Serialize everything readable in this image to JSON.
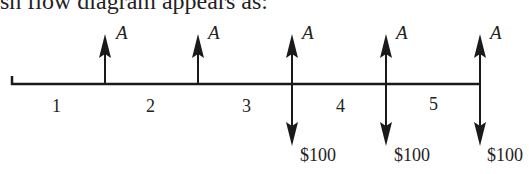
{
  "header": {
    "text": "sh flow diagram appears as:"
  },
  "diagram": {
    "type": "cash-flow-diagram",
    "periods": [
      "1",
      "2",
      "3",
      "4",
      "5"
    ],
    "receipts": [
      {
        "label": "A",
        "at_end_of_period": 1
      },
      {
        "label": "A",
        "at_end_of_period": 2
      },
      {
        "label": "A",
        "at_end_of_period": 3
      },
      {
        "label": "A",
        "at_end_of_period": 4
      },
      {
        "label": "A",
        "at_end_of_period": 5
      }
    ],
    "disbursements": [
      {
        "label": "$100",
        "at_end_of_period": 3
      },
      {
        "label": "$100",
        "at_end_of_period": 4
      },
      {
        "label": "$100",
        "at_end_of_period": 5
      }
    ],
    "colors": {
      "line": "#1a1a1a",
      "text": "#222222"
    }
  }
}
